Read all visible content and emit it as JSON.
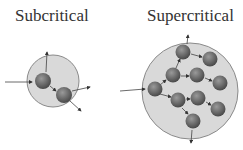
{
  "labels": {
    "subcritical": "Subcritical",
    "supercritical": "Supercritical"
  },
  "colors": {
    "sphere_fill": "#d9d9d9",
    "sphere_stroke": "#888888",
    "nucleus": "#6e6e6e",
    "arrow": "#444444"
  },
  "diagrams": [
    {
      "name": "subcritical",
      "nuclei_count": 2
    },
    {
      "name": "supercritical",
      "nuclei_count": 10
    }
  ]
}
